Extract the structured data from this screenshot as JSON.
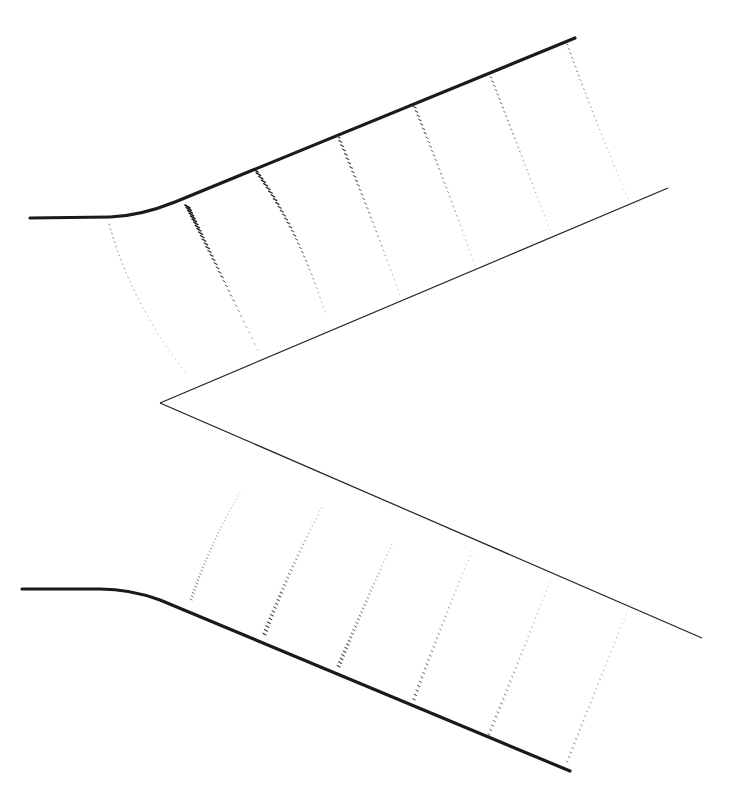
{
  "figure": {
    "width": 736,
    "height": 799,
    "colors": {
      "wall": "#1a1a1a",
      "inner_wall": "#222222",
      "vector_strong": "#1a1a1a",
      "vector_faint": "#9a9a9a"
    }
  },
  "walls": {
    "upper_outer": "M30,218 L110,217 Q140,216 175,202 L575,38",
    "lower_outer": "M22,589 L100,589 Q130,589 160,600 L570,771",
    "inner_upper": "M160,403 L668,188",
    "inner_lower": "M160,403 L702,638"
  },
  "upper_profiles": [
    {
      "x1": 110,
      "y1": 225,
      "cx": 130,
      "cy": 300,
      "x2": 185,
      "y2": 372,
      "strength": 0.25
    },
    {
      "x1": 190,
      "y1": 208,
      "cx": 210,
      "cy": 250,
      "x2": 258,
      "y2": 350,
      "strength": 1.0
    },
    {
      "x1": 258,
      "y1": 172,
      "cx": 300,
      "cy": 230,
      "x2": 325,
      "y2": 312,
      "strength": 0.85
    },
    {
      "x1": 340,
      "y1": 138,
      "cx": 370,
      "cy": 210,
      "x2": 400,
      "y2": 295,
      "strength": 0.6
    },
    {
      "x1": 416,
      "y1": 108,
      "cx": 445,
      "cy": 180,
      "x2": 475,
      "y2": 265,
      "strength": 0.5
    },
    {
      "x1": 492,
      "y1": 78,
      "cx": 520,
      "cy": 150,
      "x2": 550,
      "y2": 230,
      "strength": 0.4
    },
    {
      "x1": 568,
      "y1": 45,
      "cx": 595,
      "cy": 120,
      "x2": 628,
      "y2": 198,
      "strength": 0.3
    }
  ],
  "lower_profiles": [
    {
      "x1": 192,
      "y1": 600,
      "cx": 210,
      "cy": 545,
      "x2": 240,
      "y2": 493,
      "strength": 0.35
    },
    {
      "x1": 266,
      "y1": 635,
      "cx": 290,
      "cy": 570,
      "x2": 322,
      "y2": 508,
      "strength": 0.6
    },
    {
      "x1": 340,
      "y1": 667,
      "cx": 365,
      "cy": 605,
      "x2": 392,
      "y2": 545,
      "strength": 0.55
    },
    {
      "x1": 415,
      "y1": 700,
      "cx": 442,
      "cy": 625,
      "x2": 472,
      "y2": 552,
      "strength": 0.45
    },
    {
      "x1": 490,
      "y1": 735,
      "cx": 520,
      "cy": 660,
      "x2": 550,
      "y2": 582,
      "strength": 0.4
    },
    {
      "x1": 568,
      "y1": 762,
      "cx": 598,
      "cy": 685,
      "x2": 630,
      "y2": 605,
      "strength": 0.3
    }
  ]
}
